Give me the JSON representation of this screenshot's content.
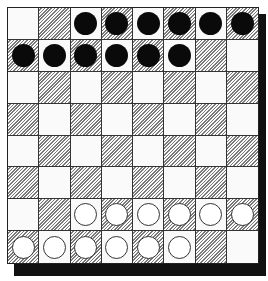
{
  "board": {
    "rows": 8,
    "cols": 8,
    "top_left_square": "light",
    "colors": {
      "light_square": "#fafafa",
      "dark_square_hatch": "#7a7a7a",
      "black_piece": "#0a0a0a",
      "white_piece": "#ffffff",
      "frame_shadow": "#111111"
    },
    "pieces": [
      [
        ".",
        ".",
        "B",
        "B",
        "B",
        "B",
        "B",
        "B"
      ],
      [
        "B",
        "B",
        "B",
        "B",
        "B",
        "B",
        ".",
        "."
      ],
      [
        ".",
        ".",
        ".",
        ".",
        ".",
        ".",
        ".",
        "."
      ],
      [
        ".",
        ".",
        ".",
        ".",
        ".",
        ".",
        ".",
        "."
      ],
      [
        ".",
        ".",
        ".",
        ".",
        ".",
        ".",
        ".",
        "."
      ],
      [
        ".",
        ".",
        ".",
        ".",
        ".",
        ".",
        ".",
        "."
      ],
      [
        ".",
        ".",
        "W",
        "W",
        "W",
        "W",
        "W",
        "W"
      ],
      [
        "W",
        "W",
        "W",
        "W",
        "W",
        "W",
        ".",
        "."
      ]
    ],
    "piece_counts": {
      "black": 12,
      "white": 12
    }
  }
}
